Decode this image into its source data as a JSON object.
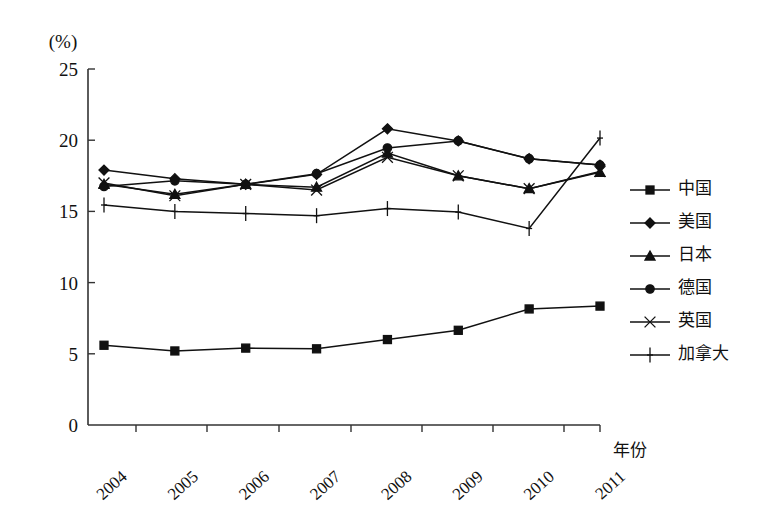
{
  "chart_data": {
    "type": "line",
    "title": "",
    "xlabel": "年份",
    "ylabel": "(%)",
    "ylim": [
      0,
      25
    ],
    "yticks": [
      0,
      5,
      10,
      15,
      20,
      25
    ],
    "grid": false,
    "legend_position": "right",
    "categories": [
      "2004",
      "2005",
      "2006",
      "2007",
      "2008",
      "2009",
      "2010",
      "2011"
    ],
    "series": [
      {
        "name": "中国",
        "marker": "square",
        "values": [
          5.6,
          5.2,
          5.4,
          5.35,
          6.0,
          6.65,
          8.15,
          8.35
        ]
      },
      {
        "name": "美国",
        "marker": "diamond",
        "values": [
          17.9,
          17.3,
          16.9,
          17.6,
          20.8,
          19.95,
          18.7,
          18.25
        ]
      },
      {
        "name": "日本",
        "marker": "triangle",
        "values": [
          16.9,
          16.2,
          16.9,
          16.7,
          19.1,
          17.5,
          16.6,
          17.75
        ]
      },
      {
        "name": "德国",
        "marker": "circle",
        "values": [
          16.75,
          17.15,
          16.9,
          17.65,
          19.45,
          19.95,
          18.7,
          18.25
        ]
      },
      {
        "name": "英国",
        "marker": "cross",
        "values": [
          17.0,
          16.1,
          16.9,
          16.5,
          18.8,
          17.5,
          16.6,
          17.8
        ]
      },
      {
        "name": "加拿大",
        "marker": "plus",
        "values": [
          15.45,
          15.0,
          14.85,
          14.7,
          15.2,
          14.95,
          13.8,
          20.15
        ]
      }
    ]
  },
  "legend": {
    "items": [
      {
        "label": "中国"
      },
      {
        "label": "美国"
      },
      {
        "label": "日本"
      },
      {
        "label": "德国"
      },
      {
        "label": "英国"
      },
      {
        "label": "加拿大"
      }
    ]
  },
  "axis": {
    "y_unit": "(%)",
    "x_title": "年份",
    "y_tick_labels": [
      "0",
      "5",
      "10",
      "15",
      "20",
      "25"
    ],
    "x_tick_labels": [
      "2004",
      "2005",
      "2006",
      "2007",
      "2008",
      "2009",
      "2010",
      "2011"
    ]
  }
}
